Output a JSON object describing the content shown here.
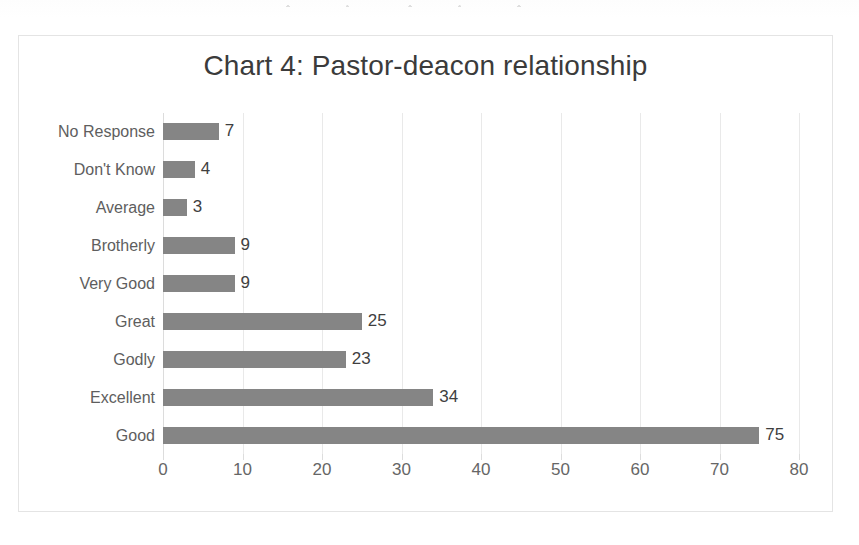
{
  "page": {
    "background_color": "#ffffff",
    "cropped_text_above": ""
  },
  "chart": {
    "title": "Chart 4: Pastor-deacon relationship",
    "border_color": "#e4e4e4",
    "bar_color": "#858585",
    "gridline_color": "#e9e9e9",
    "label_color": "#5e5e5e",
    "tick_color": "#666666"
  },
  "chart_data": {
    "type": "bar",
    "orientation": "horizontal",
    "title": "Chart 4: Pastor-deacon relationship",
    "xlabel": "",
    "ylabel": "",
    "categories": [
      "No Response",
      "Don't Know",
      "Average",
      "Brotherly",
      "Very Good",
      "Great",
      "Godly",
      "Excellent",
      "Good"
    ],
    "values": [
      7,
      4,
      3,
      9,
      9,
      25,
      23,
      34,
      75
    ],
    "data_labels": [
      "7",
      "4",
      "3",
      "9",
      "9",
      "25",
      "23",
      "34",
      "75"
    ],
    "xlim": [
      0,
      80
    ],
    "xticks": [
      0,
      10,
      20,
      30,
      40,
      50,
      60,
      70,
      80
    ],
    "xtick_labels": [
      "0",
      "10",
      "20",
      "30",
      "40",
      "50",
      "60",
      "70",
      "80"
    ],
    "grid": true,
    "grid_axis": "x",
    "legend": false,
    "series": [
      {
        "name": "Responses",
        "values": [
          7,
          4,
          3,
          9,
          9,
          25,
          23,
          34,
          75
        ]
      }
    ]
  }
}
